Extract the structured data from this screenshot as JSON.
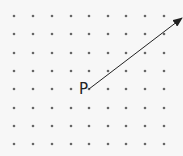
{
  "diagram": {
    "grid": {
      "columns": 9,
      "rows": 8,
      "x_positions": [
        14,
        33,
        52,
        71,
        89,
        108,
        126,
        145,
        164
      ],
      "y_positions": [
        16,
        34,
        53,
        71,
        89,
        108,
        126,
        144
      ],
      "dot_color": "#666666"
    },
    "point": {
      "label": "P",
      "column": 5,
      "row": 5,
      "x": 89,
      "y": 89
    },
    "vector": {
      "from": [
        89,
        89
      ],
      "to": [
        182,
        18
      ],
      "color": "#222222"
    }
  }
}
